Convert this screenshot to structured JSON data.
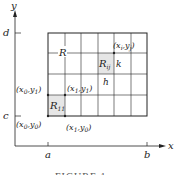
{
  "figure": {
    "axes": {
      "x_label": "x",
      "y_label": "y",
      "x_ticks": [
        "a",
        "b"
      ],
      "y_ticks": [
        "c",
        "d"
      ]
    },
    "region_label": "R",
    "grid": {
      "columns": 6,
      "rows": 4
    },
    "cells": {
      "first": {
        "label": "R",
        "sub": "11"
      },
      "general": {
        "label": "R",
        "sub": "ij"
      }
    },
    "dimensions": {
      "width": "h",
      "height": "k"
    },
    "points": {
      "x0y1": {
        "open": "(x",
        "s1": "0",
        "mid": ",y",
        "s2": "1",
        "close": ")"
      },
      "x1y1": {
        "open": "(x",
        "s1": "1",
        "mid": ",y",
        "s2": "1",
        "close": ")"
      },
      "x0y0": {
        "open": "(x",
        "s1": "0",
        "mid": ",y",
        "s2": "0",
        "close": ")"
      },
      "x1y0": {
        "open": "(x",
        "s1": "1",
        "mid": ",y",
        "s2": "0",
        "close": ")"
      },
      "xiyj": {
        "open": "(x",
        "s1": "i",
        "mid": ",y",
        "s2": "j",
        "close": ")"
      }
    },
    "caption": "FIGURE 1",
    "colors": {
      "line": "#222222",
      "shade": "#e6e6e6"
    }
  }
}
